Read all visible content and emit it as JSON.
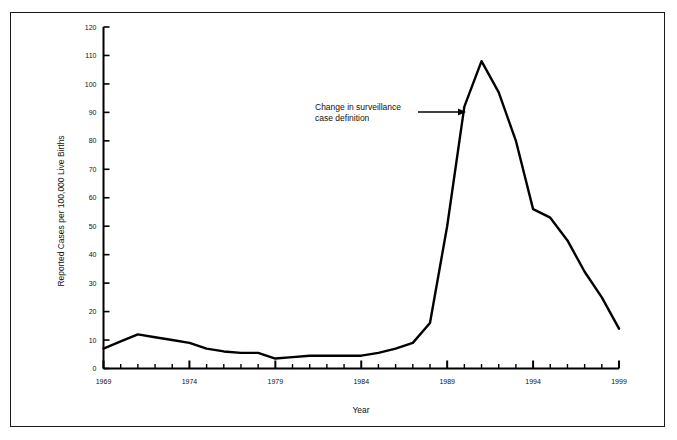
{
  "figure": {
    "border_color": "#1a1a1a",
    "background": "#ffffff",
    "line_color": "#000000"
  },
  "chart_data": {
    "type": "line",
    "title": "",
    "subtitle": "",
    "xlabel": "Year",
    "ylabel": "Reported Cases per 100,000 Live Births",
    "xlim": [
      1969,
      1999
    ],
    "ylim": [
      0,
      120
    ],
    "grid": false,
    "legend": "none",
    "x_tick_step": 1,
    "x_label_step": 5,
    "y_tick_step": 10,
    "x_tick_labels": [
      "1969",
      "1974",
      "1979",
      "1984",
      "1989",
      "1994",
      "1999"
    ],
    "y_tick_labels": [
      "0",
      "10",
      "20",
      "30",
      "40",
      "50",
      "60",
      "70",
      "80",
      "90",
      "100",
      "110",
      "120"
    ],
    "series": [
      {
        "name": "Reported cases per 100,000 live births",
        "x": [
          1969,
          1970,
          1971,
          1972,
          1973,
          1974,
          1975,
          1976,
          1977,
          1978,
          1979,
          1980,
          1981,
          1982,
          1983,
          1984,
          1985,
          1986,
          1987,
          1988,
          1989,
          1990,
          1991,
          1992,
          1993,
          1994,
          1995,
          1996,
          1997,
          1998,
          1999
        ],
        "values": [
          7,
          9.5,
          12,
          11,
          10,
          9,
          7,
          6,
          5.5,
          5.5,
          3.5,
          4,
          4.5,
          4.5,
          4.5,
          4.5,
          5.5,
          7,
          9,
          16,
          50,
          92,
          108,
          97,
          80,
          56,
          53,
          45,
          34,
          25,
          14
        ]
      }
    ],
    "annotations": [
      {
        "name": "surveillance-definition-note",
        "text_line_1": "Change in surveillance",
        "text_line_2": "case definition",
        "arrow": "right-arrow",
        "points_to_year": 1990,
        "points_to_value": 92
      }
    ]
  }
}
